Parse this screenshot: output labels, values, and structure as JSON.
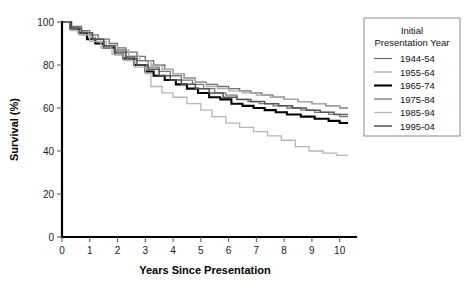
{
  "chart_data": {
    "type": "line",
    "title": "",
    "xlabel": "Years Since Presentation",
    "ylabel": "Survival (%)",
    "xlim": [
      0,
      10.3
    ],
    "ylim": [
      0,
      100
    ],
    "xticks": [
      0,
      1,
      2,
      3,
      4,
      5,
      6,
      7,
      8,
      9,
      10
    ],
    "yticks": [
      0,
      20,
      40,
      60,
      80,
      100
    ],
    "grid": false,
    "legend_position": "right-top",
    "legend_title": "Initial\nPresentation Year",
    "legend_title_line1": "Initial",
    "legend_title_line2": "Presentation Year",
    "series": [
      {
        "name": "1944-54",
        "color": "#6e6e6e",
        "width": 1.3,
        "x": [
          0,
          0.35,
          0.7,
          1.0,
          1.3,
          1.7,
          2.0,
          2.3,
          2.7,
          3.0,
          3.3,
          3.7,
          4.0,
          4.4,
          4.8,
          5.2,
          5.6,
          6.0,
          6.4,
          6.8,
          7.2,
          7.6,
          8.0,
          8.5,
          9.0,
          9.5,
          10.0,
          10.3
        ],
        "y": [
          100,
          98,
          96,
          94,
          92,
          90,
          88,
          86,
          84,
          82,
          80,
          78,
          76,
          74,
          72,
          71,
          70,
          69,
          68,
          67,
          66,
          65,
          64,
          63,
          62,
          61,
          60,
          60
        ]
      },
      {
        "name": "1955-64",
        "color": "#a8a8a8",
        "width": 1.3,
        "x": [
          0,
          0.3,
          0.6,
          0.9,
          1.2,
          1.6,
          2.0,
          2.4,
          2.8,
          3.2,
          3.6,
          4.0,
          4.4,
          4.8,
          5.2,
          5.6,
          6.0,
          6.5,
          7.0,
          7.5,
          8.0,
          8.5,
          9.0,
          9.5,
          10.0,
          10.3
        ],
        "y": [
          100,
          97,
          95,
          93,
          91,
          89,
          87,
          84,
          82,
          80,
          78,
          76,
          74,
          72,
          70,
          69,
          68,
          67,
          66,
          65,
          64,
          63,
          62,
          61,
          60,
          60
        ]
      },
      {
        "name": "1965-74",
        "color": "#000000",
        "width": 2.1,
        "x": [
          0,
          0.3,
          0.6,
          0.9,
          1.2,
          1.5,
          1.9,
          2.2,
          2.6,
          3.0,
          3.3,
          3.7,
          4.1,
          4.5,
          4.9,
          5.3,
          5.7,
          6.1,
          6.5,
          6.9,
          7.3,
          7.7,
          8.1,
          8.6,
          9.1,
          9.6,
          10.0,
          10.3
        ],
        "y": [
          100,
          97,
          95,
          92,
          90,
          88,
          85,
          83,
          80,
          77,
          75,
          73,
          71,
          69,
          67,
          65,
          64,
          62,
          61,
          60,
          59,
          58,
          57,
          56,
          55,
          54,
          53,
          53
        ]
      },
      {
        "name": "1975-84",
        "color": "#787878",
        "width": 1.3,
        "x": [
          0,
          0.3,
          0.7,
          1.1,
          1.5,
          1.9,
          2.3,
          2.7,
          3.1,
          3.5,
          3.9,
          4.3,
          4.7,
          5.1,
          5.5,
          5.9,
          6.3,
          6.7,
          7.1,
          7.6,
          8.1,
          8.6,
          9.1,
          9.6,
          10.0,
          10.3
        ],
        "y": [
          100,
          97,
          94,
          92,
          89,
          87,
          84,
          82,
          79,
          77,
          75,
          73,
          71,
          69,
          67,
          66,
          64,
          63,
          62,
          61,
          60,
          59,
          58,
          57,
          56,
          56
        ]
      },
      {
        "name": "1985-94",
        "color": "#b5b5b5",
        "width": 1.3,
        "x": [
          0,
          0.3,
          0.6,
          1.0,
          1.4,
          1.8,
          2.2,
          2.6,
          3.0,
          3.2,
          3.6,
          4.0,
          4.5,
          5.0,
          5.4,
          5.9,
          6.4,
          6.9,
          7.4,
          7.9,
          8.4,
          8.9,
          9.4,
          9.9,
          10.3
        ],
        "y": [
          100,
          96,
          94,
          91,
          88,
          85,
          82,
          79,
          76,
          70,
          67,
          65,
          62,
          59,
          56,
          53,
          51,
          49,
          47,
          45,
          42,
          40,
          39,
          38,
          38
        ]
      },
      {
        "name": "1995-04",
        "color": "#555555",
        "width": 1.5,
        "x": [
          0,
          0.3,
          0.7,
          1.1,
          1.5,
          1.9,
          2.3,
          2.7,
          3.1,
          3.5,
          3.9,
          4.3,
          4.8,
          5.3,
          5.8,
          6.3,
          6.8,
          7.3,
          7.8,
          8.3,
          8.8,
          9.3,
          9.8,
          10.3
        ],
        "y": [
          100,
          97,
          95,
          92,
          89,
          86,
          83,
          80,
          78,
          75,
          73,
          71,
          69,
          67,
          65,
          64,
          63,
          62,
          61,
          60,
          59,
          58,
          57,
          57
        ]
      }
    ]
  }
}
